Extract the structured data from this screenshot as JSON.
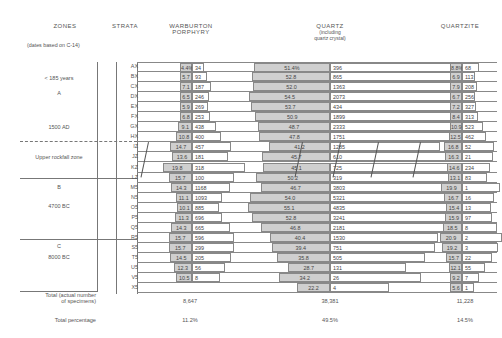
{
  "headers": {
    "zones": "ZONES",
    "strata": "STRATA",
    "warburton_line1": "WARBURTON",
    "warburton_line2": "PORPHYRY",
    "quartz_line1": "QUARTZ",
    "quartz_line2": "(including",
    "quartz_line3": "quartz crystal)",
    "quartzite": "QUARTZITE"
  },
  "note": "(dates based on C-14)",
  "zones": [
    {
      "lines": [
        "< 185 years",
        "A",
        "1500 AD"
      ]
    },
    {
      "lines": [
        "Upper rockfall zone"
      ]
    },
    {
      "lines": [
        "B",
        "4700 BC"
      ]
    },
    {
      "lines": [
        "C",
        "8000 BC"
      ]
    }
  ],
  "totals": {
    "count_label_line1": "Total (actual number",
    "count_label_line2": "of specimens)",
    "pct_label": "Total percentage",
    "warburton_count": "8,647",
    "quartz_count": "38,381",
    "quartzite_count": "11,228",
    "warburton_pct": "11.2%",
    "quartz_pct": "49.5%",
    "quartzite_pct": "14.5%"
  },
  "chart_data": {
    "type": "table",
    "columns": [
      "Stratum",
      "Warburton Porphyry %",
      "Warburton Porphyry n",
      "Quartz %",
      "Quartz n",
      "Quartzite %",
      "Quartzite n"
    ],
    "rows": [
      {
        "stratum": "AX",
        "wp_pct": "4.4%",
        "wp_n": "34",
        "q_pct": "51.4%",
        "q_n": "396",
        "qz_pct": "8.8%",
        "qz_n": "68"
      },
      {
        "stratum": "BX",
        "wp_pct": "5.7",
        "wp_n": "93",
        "q_pct": "52.8",
        "q_n": "865",
        "qz_pct": "6.9",
        "qz_n": "113"
      },
      {
        "stratum": "CX",
        "wp_pct": "7.1",
        "wp_n": "187",
        "q_pct": "52.0",
        "q_n": "1363",
        "qz_pct": "7.9",
        "qz_n": "208"
      },
      {
        "stratum": "DX",
        "wp_pct": "6.5",
        "wp_n": "246",
        "q_pct": "54.5",
        "q_n": "2073",
        "qz_pct": "6.7",
        "qz_n": "256"
      },
      {
        "stratum": "EX",
        "wp_pct": "5.9",
        "wp_n": "269",
        "q_pct": "53.7",
        "q_n": "434",
        "qz_pct": "7.2",
        "qz_n": "327"
      },
      {
        "stratum": "FX",
        "wp_pct": "6.8",
        "wp_n": "253",
        "q_pct": "50.9",
        "q_n": "1899",
        "qz_pct": "8.4",
        "qz_n": "313"
      },
      {
        "stratum": "GX",
        "wp_pct": "9.1",
        "wp_n": "438",
        "q_pct": "48.7",
        "q_n": "2333",
        "qz_pct": "10.9",
        "qz_n": "523"
      },
      {
        "stratum": "HX",
        "wp_pct": "10.8",
        "wp_n": "400",
        "q_pct": "47.8",
        "q_n": "1751",
        "qz_pct": "12.5",
        "qz_n": "462"
      },
      {
        "stratum": "IZ",
        "wp_pct": "14.7",
        "wp_n": "457",
        "q_pct": "41.2",
        "q_n": "1285",
        "qz_pct": "16.8",
        "qz_n": "52"
      },
      {
        "stratum": "JZ",
        "wp_pct": "13.6",
        "wp_n": "181",
        "q_pct": "45.7",
        "q_n": "610",
        "qz_pct": "16.3",
        "qz_n": "21"
      },
      {
        "stratum": "KZ",
        "wp_pct": "19.8",
        "wp_n": "318",
        "q_pct": "45.1",
        "q_n": "725",
        "qz_pct": "14.6",
        "qz_n": "234"
      },
      {
        "stratum": "LZ",
        "wp_pct": "15.7",
        "wp_n": "100",
        "q_pct": "50.2",
        "q_n": "319",
        "qz_pct": "13.1",
        "qz_n": "83"
      },
      {
        "stratum": "M5",
        "wp_pct": "14.3",
        "wp_n": "1168",
        "q_pct": "46.7",
        "q_n": "3803",
        "qz_pct": "19.9",
        "qz_n": "1"
      },
      {
        "stratum": "N5",
        "wp_pct": "11.1",
        "wp_n": "1093",
        "q_pct": "54.0",
        "q_n": "5321",
        "qz_pct": "16.7",
        "qz_n": "16"
      },
      {
        "stratum": "O5",
        "wp_pct": "10.1",
        "wp_n": "885",
        "q_pct": "55.1",
        "q_n": "4835",
        "qz_pct": "15.4",
        "qz_n": "13"
      },
      {
        "stratum": "P5",
        "wp_pct": "11.3",
        "wp_n": "696",
        "q_pct": "52.8",
        "q_n": "3241",
        "qz_pct": "15.9",
        "qz_n": "97"
      },
      {
        "stratum": "Q5",
        "wp_pct": "14.3",
        "wp_n": "665",
        "q_pct": "46.8",
        "q_n": "2181",
        "qz_pct": "18.5",
        "qz_n": "8"
      },
      {
        "stratum": "R5",
        "wp_pct": "15.7",
        "wp_n": "596",
        "q_pct": "40.4",
        "q_n": "1530",
        "qz_pct": "20.9",
        "qz_n": "2"
      },
      {
        "stratum": "S5",
        "wp_pct": "15.7",
        "wp_n": "299",
        "q_pct": "39.4",
        "q_n": "751",
        "qz_pct": "19.2",
        "qz_n": "3"
      },
      {
        "stratum": "T5",
        "wp_pct": "14.5",
        "wp_n": "205",
        "q_pct": "35.8",
        "q_n": "505",
        "qz_pct": "15.7",
        "qz_n": "22"
      },
      {
        "stratum": "U5",
        "wp_pct": "12.3",
        "wp_n": "56",
        "q_pct": "28.7",
        "q_n": "131",
        "qz_pct": "12.1",
        "qz_n": "55"
      },
      {
        "stratum": "V5",
        "wp_pct": "10.5",
        "wp_n": "8",
        "q_pct": "34.2",
        "q_n": "26",
        "qz_pct": "9.2",
        "qz_n": "7"
      },
      {
        "stratum": "X5",
        "wp_pct": "",
        "wp_n": "",
        "q_pct": "22.2",
        "q_n": "4",
        "qz_pct": "5.6",
        "qz_n": "1"
      }
    ],
    "legend": [],
    "grid": false
  }
}
